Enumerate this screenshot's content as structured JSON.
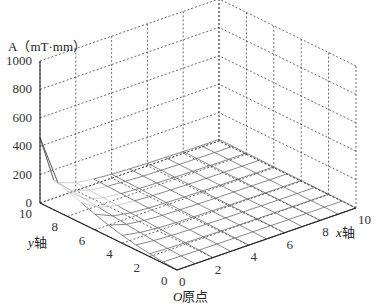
{
  "chart_data": {
    "type": "surface3d",
    "title": "",
    "zlabel": "A（mT·mm）",
    "xlabel": "x轴",
    "ylabel": "y轴",
    "origin_label": "O原点",
    "zlim": [
      0,
      1000
    ],
    "xlim": [
      0,
      10
    ],
    "ylim": [
      0,
      10
    ],
    "z_ticks": [
      "0",
      "200",
      "400",
      "600",
      "800",
      "1000"
    ],
    "x_ticks": [
      "0",
      "2",
      "4",
      "6",
      "8",
      "10"
    ],
    "y_ticks": [
      "0",
      "2",
      "4",
      "6",
      "8",
      "10"
    ],
    "grid": true,
    "grid_style": "dashed",
    "x": [
      0,
      1,
      2,
      3,
      4,
      5,
      6,
      7,
      8,
      9,
      10
    ],
    "y": [
      0,
      1,
      2,
      3,
      4,
      5,
      6,
      7,
      8,
      9,
      10
    ],
    "peak": {
      "x": 0,
      "y": 10,
      "A": 460
    },
    "surface_note": "Sharp peak (~460) at x=0,y=10; ridge ~200 along x=0 edge; surface decays toward ~0-60 elsewhere",
    "z_values": [
      [
        0,
        0,
        0,
        0,
        0,
        0,
        0,
        0,
        0,
        0,
        0
      ],
      [
        10,
        8,
        6,
        5,
        4,
        3,
        3,
        2,
        2,
        2,
        2
      ],
      [
        20,
        14,
        10,
        8,
        6,
        5,
        4,
        4,
        3,
        3,
        3
      ],
      [
        35,
        22,
        15,
        11,
        9,
        7,
        6,
        5,
        4,
        4,
        4
      ],
      [
        55,
        32,
        20,
        14,
        11,
        9,
        7,
        6,
        5,
        5,
        5
      ],
      [
        80,
        42,
        26,
        18,
        14,
        11,
        9,
        8,
        7,
        6,
        6
      ],
      [
        110,
        54,
        32,
        22,
        17,
        13,
        11,
        9,
        8,
        7,
        7
      ],
      [
        145,
        66,
        38,
        26,
        19,
        15,
        12,
        10,
        9,
        8,
        8
      ],
      [
        180,
        78,
        44,
        30,
        22,
        17,
        14,
        12,
        10,
        9,
        9
      ],
      [
        210,
        90,
        50,
        34,
        25,
        19,
        16,
        13,
        11,
        10,
        10
      ],
      [
        460,
        100,
        56,
        38,
        28,
        22,
        18,
        15,
        13,
        11,
        11
      ]
    ]
  },
  "labels": {
    "zlabel": "A（mT·mm）",
    "xlabel": "x轴",
    "ylabel": "y轴",
    "origin": "O原点"
  }
}
